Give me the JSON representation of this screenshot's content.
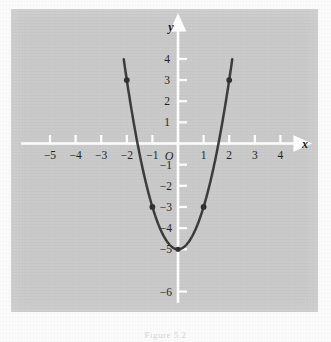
{
  "figure": {
    "caption": "Figure 5.2",
    "panel_color": "#c9c9c9",
    "axis_color": "#ffffff",
    "curve_color": "#3a3a3a",
    "point_color": "#2e2e2e",
    "label_color": "#1d1d1d"
  },
  "axes": {
    "x_name": "x",
    "y_name": "y",
    "origin_label": "O",
    "x_ticks": [
      {
        "value": -5,
        "label": "−5"
      },
      {
        "value": -4,
        "label": "−4"
      },
      {
        "value": -3,
        "label": "−3"
      },
      {
        "value": -2,
        "label": "−2"
      },
      {
        "value": -1,
        "label": "−1"
      },
      {
        "value": 1,
        "label": "1"
      },
      {
        "value": 2,
        "label": "2"
      },
      {
        "value": 3,
        "label": "3"
      },
      {
        "value": 4,
        "label": "4"
      }
    ],
    "y_ticks": [
      {
        "value": 4,
        "label": "4"
      },
      {
        "value": 3,
        "label": "3"
      },
      {
        "value": 2,
        "label": "2"
      },
      {
        "value": 1,
        "label": "1"
      },
      {
        "value": -1,
        "label": "−1"
      },
      {
        "value": -2,
        "label": "−2"
      },
      {
        "value": -3,
        "label": "−3"
      },
      {
        "value": -4,
        "label": "−4"
      },
      {
        "value": -5,
        "label": "−5"
      },
      {
        "value": -6,
        "label": "−6"
      }
    ]
  },
  "chart_data": {
    "type": "line",
    "title": "",
    "subtitle": "",
    "xlabel": "x",
    "ylabel": "y",
    "xlim": [
      -5.8,
      4.9
    ],
    "ylim": [
      -6.9,
      4.7
    ],
    "grid": false,
    "legend": null,
    "annotations": [],
    "series": [
      {
        "name": "y = 2x^2 - 5",
        "equation": "y = 2x² − 5",
        "kind": "parabola",
        "a": 2,
        "b": 0,
        "c": -5,
        "vertex": [
          0,
          -5
        ],
        "x_domain": [
          -2.12,
          2.12
        ],
        "x": [
          -2.12,
          -2.0,
          -1.75,
          -1.5,
          -1.25,
          -1.0,
          -0.75,
          -0.5,
          -0.25,
          0,
          0.25,
          0.5,
          0.75,
          1.0,
          1.25,
          1.5,
          1.75,
          2.0,
          2.12
        ],
        "values": [
          4.0,
          3.0,
          1.125,
          -0.5,
          -1.875,
          -3.0,
          -3.875,
          -4.5,
          -4.875,
          -5.0,
          -4.875,
          -4.5,
          -3.875,
          -3.0,
          -1.875,
          -0.5,
          1.125,
          3.0,
          4.0
        ]
      }
    ],
    "marked_points": [
      {
        "x": -2,
        "y": 3,
        "label": "(−2, 3)"
      },
      {
        "x": -1,
        "y": -3,
        "label": "(−1, −3)"
      },
      {
        "x": 0,
        "y": -5,
        "label": "(0, −5)"
      },
      {
        "x": 1,
        "y": -3,
        "label": "(1, −3)"
      },
      {
        "x": 2,
        "y": 3,
        "label": "(2, 3)"
      }
    ]
  }
}
